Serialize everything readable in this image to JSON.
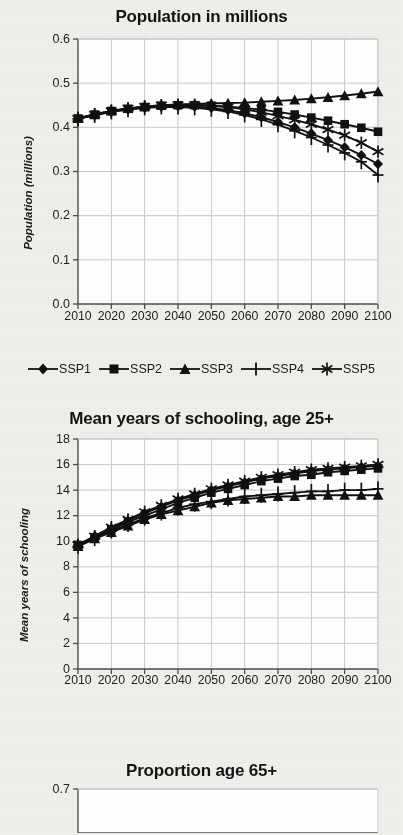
{
  "figure": {
    "background_color": "#efefec",
    "ink_color": "#111111",
    "grid_color": "#c9c9c9",
    "axis_color": "#4d4d4d"
  },
  "legend": {
    "items": [
      {
        "label": "SSP1",
        "marker": "diamond-marker"
      },
      {
        "label": "SSP2",
        "marker": "square-marker"
      },
      {
        "label": "SSP3",
        "marker": "triangle-marker"
      },
      {
        "label": "SSP4",
        "marker": "plus-marker"
      },
      {
        "label": "SSP5",
        "marker": "asterisk-marker"
      }
    ]
  },
  "chart_data": [
    {
      "type": "line",
      "title": "Population in millions",
      "xlabel": "",
      "ylabel": "Population (millions)",
      "x": [
        2010,
        2015,
        2020,
        2025,
        2030,
        2035,
        2040,
        2045,
        2050,
        2055,
        2060,
        2065,
        2070,
        2075,
        2080,
        2085,
        2090,
        2095,
        2100
      ],
      "xlim": [
        2010,
        2100
      ],
      "xticks": [
        2010,
        2020,
        2030,
        2040,
        2050,
        2060,
        2070,
        2080,
        2090,
        2100
      ],
      "ylim": [
        0.0,
        0.6
      ],
      "yticks": [
        0.0,
        0.1,
        0.2,
        0.3,
        0.4,
        0.5,
        0.6
      ],
      "ytick_labels": [
        "0.0",
        "0.1",
        "0.2",
        "0.3",
        "0.4",
        "0.5",
        "0.6"
      ],
      "grid": true,
      "legend_position": "below",
      "series": [
        {
          "name": "SSP1",
          "marker": "diamond-marker",
          "values": [
            0.42,
            0.428,
            0.436,
            0.441,
            0.445,
            0.447,
            0.448,
            0.447,
            0.444,
            0.439,
            0.432,
            0.423,
            0.412,
            0.4,
            0.386,
            0.371,
            0.355,
            0.337,
            0.317
          ]
        },
        {
          "name": "SSP2",
          "marker": "square-marker",
          "values": [
            0.42,
            0.429,
            0.437,
            0.442,
            0.446,
            0.449,
            0.45,
            0.45,
            0.449,
            0.447,
            0.444,
            0.44,
            0.435,
            0.429,
            0.422,
            0.415,
            0.407,
            0.399,
            0.39
          ]
        },
        {
          "name": "SSP3",
          "marker": "triangle-marker",
          "values": [
            0.42,
            0.429,
            0.437,
            0.443,
            0.447,
            0.45,
            0.452,
            0.453,
            0.454,
            0.455,
            0.456,
            0.458,
            0.46,
            0.462,
            0.465,
            0.468,
            0.472,
            0.476,
            0.481
          ]
        },
        {
          "name": "SSP4",
          "marker": "plus-marker",
          "values": [
            0.419,
            0.427,
            0.435,
            0.44,
            0.444,
            0.446,
            0.446,
            0.444,
            0.441,
            0.436,
            0.428,
            0.418,
            0.406,
            0.392,
            0.377,
            0.36,
            0.342,
            0.322,
            0.292
          ]
        },
        {
          "name": "SSP5",
          "marker": "asterisk-marker",
          "values": [
            0.42,
            0.429,
            0.437,
            0.443,
            0.447,
            0.45,
            0.451,
            0.451,
            0.449,
            0.446,
            0.441,
            0.434,
            0.426,
            0.417,
            0.407,
            0.395,
            0.382,
            0.365,
            0.345
          ]
        }
      ]
    },
    {
      "type": "line",
      "title": "Mean years of schooling, age 25+",
      "xlabel": "",
      "ylabel": "Mean years of schooling",
      "x": [
        2010,
        2015,
        2020,
        2025,
        2030,
        2035,
        2040,
        2045,
        2050,
        2055,
        2060,
        2065,
        2070,
        2075,
        2080,
        2085,
        2090,
        2095,
        2100
      ],
      "xlim": [
        2010,
        2100
      ],
      "xticks": [
        2010,
        2020,
        2030,
        2040,
        2050,
        2060,
        2070,
        2080,
        2090,
        2100
      ],
      "ylim": [
        0,
        18
      ],
      "yticks": [
        0,
        2,
        4,
        6,
        8,
        10,
        12,
        14,
        16,
        18
      ],
      "ytick_labels": [
        "0",
        "2",
        "4",
        "6",
        "8",
        "10",
        "12",
        "14",
        "16",
        "18"
      ],
      "grid": true,
      "legend_position": "none",
      "series": [
        {
          "name": "SSP1",
          "marker": "diamond-marker",
          "values": [
            9.7,
            10.4,
            11.0,
            11.6,
            12.2,
            12.7,
            13.2,
            13.6,
            14.0,
            14.3,
            14.6,
            14.9,
            15.1,
            15.3,
            15.5,
            15.6,
            15.7,
            15.8,
            15.9
          ]
        },
        {
          "name": "SSP2",
          "marker": "square-marker",
          "values": [
            9.7,
            10.3,
            10.9,
            11.5,
            12.0,
            12.5,
            13.0,
            13.4,
            13.8,
            14.1,
            14.4,
            14.7,
            14.9,
            15.1,
            15.2,
            15.4,
            15.5,
            15.6,
            15.7
          ]
        },
        {
          "name": "SSP3",
          "marker": "triangle-marker",
          "values": [
            9.6,
            10.2,
            10.7,
            11.2,
            11.7,
            12.1,
            12.4,
            12.7,
            13.0,
            13.2,
            13.3,
            13.4,
            13.5,
            13.5,
            13.6,
            13.6,
            13.6,
            13.6,
            13.6
          ]
        },
        {
          "name": "SSP4",
          "marker": "plus-marker",
          "values": [
            9.6,
            10.2,
            10.8,
            11.3,
            11.8,
            12.2,
            12.6,
            12.9,
            13.1,
            13.3,
            13.5,
            13.6,
            13.7,
            13.8,
            13.9,
            13.9,
            14.0,
            14.0,
            14.1
          ]
        },
        {
          "name": "SSP5",
          "marker": "asterisk-marker",
          "values": [
            9.7,
            10.4,
            11.1,
            11.7,
            12.3,
            12.8,
            13.3,
            13.7,
            14.1,
            14.4,
            14.7,
            15.0,
            15.2,
            15.4,
            15.6,
            15.7,
            15.8,
            15.9,
            16.0
          ]
        }
      ]
    },
    {
      "type": "line",
      "title": "Proportion age 65+",
      "xlabel": "",
      "ylabel": "",
      "x": [],
      "xlim": [
        2010,
        2100
      ],
      "xticks": [],
      "ylim": [
        0.0,
        0.7
      ],
      "yticks": [
        0.7
      ],
      "ytick_labels": [
        "0.7"
      ],
      "grid": true,
      "legend_position": "none",
      "clipped": true,
      "series": []
    }
  ]
}
